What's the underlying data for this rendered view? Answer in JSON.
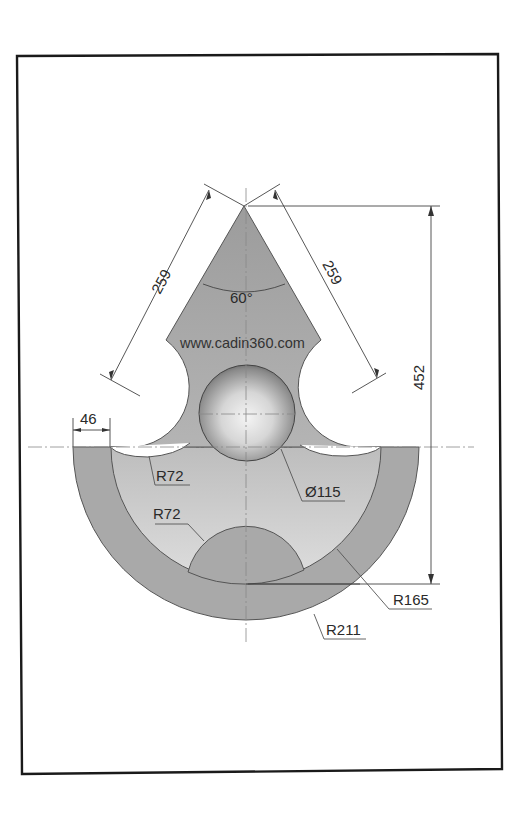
{
  "drawing": {
    "watermark": "www.cadin360.com",
    "colors": {
      "part_fill": "#a8a8a8",
      "part_fill_light": "#cfcfcf",
      "frame": "#1a1a1a",
      "dim_text": "#2a2a2a"
    },
    "dimensions": {
      "left_edge_length": "259",
      "right_edge_length": "259",
      "apex_angle": "60°",
      "overall_height": "452",
      "ring_width": "46",
      "upper_cutout_radius": "R72",
      "lower_bump_radius": "R72",
      "sphere_diameter": "Ø115",
      "inner_radius": "R165",
      "outer_radius": "R211"
    }
  }
}
